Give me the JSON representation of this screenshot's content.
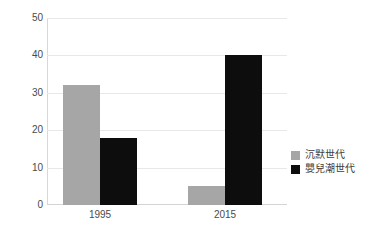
{
  "chart_data": {
    "type": "bar",
    "title": "",
    "subtitle": "",
    "xlabel": "",
    "ylabel": "",
    "categories": [
      "1995",
      "2015"
    ],
    "series": [
      {
        "name": "沉默世代",
        "values": [
          32,
          5
        ],
        "color": "#a6a6a6"
      },
      {
        "name": "嬰兒潮世代",
        "values": [
          18,
          40
        ],
        "color": "#0d0d0d"
      }
    ],
    "yticks": [
      0,
      10,
      20,
      30,
      40,
      50
    ],
    "ylim": [
      0,
      50
    ],
    "grid": true,
    "legend_position": "right",
    "annotations": []
  },
  "legend": {
    "items": [
      {
        "label": "沉默世代",
        "swatch": "silent-swatch"
      },
      {
        "label": "嬰兒潮世代",
        "swatch": "boomer-swatch"
      }
    ]
  }
}
